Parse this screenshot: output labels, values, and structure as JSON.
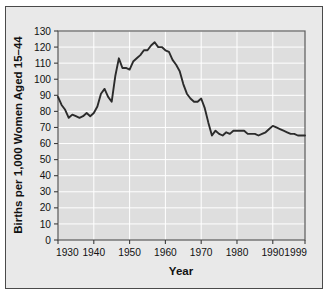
{
  "figure": {
    "background_color": "#ffffff",
    "frame_color": "#e9e9e9",
    "frame_border_color": "#4a4a4a",
    "plot_background_color": "#dedede",
    "gridline_color": "#ffffff",
    "axis_color": "#3c3c3c",
    "line_color": "#2b2b2b"
  },
  "chart_data": {
    "type": "line",
    "title": "",
    "xlabel": "Year",
    "ylabel": "Births per 1,000 Women Aged 15–44",
    "xlim": [
      1930,
      1999
    ],
    "ylim": [
      0,
      130
    ],
    "grid": true,
    "legend": "none",
    "xticks": [
      1930,
      1940,
      1950,
      1960,
      1970,
      1980,
      1990,
      1999
    ],
    "xtick_labels": [
      "1930",
      "1940",
      "1950",
      "1960",
      "1970",
      "1980",
      "1990",
      "1999"
    ],
    "yticks": [
      0,
      10,
      20,
      30,
      40,
      50,
      60,
      70,
      80,
      90,
      100,
      110,
      120,
      130
    ],
    "ytick_labels": [
      "0",
      "10",
      "20",
      "30",
      "40",
      "50",
      "60",
      "70",
      "80",
      "90",
      "100",
      "110",
      "120",
      "130"
    ],
    "x": [
      1930,
      1931,
      1932,
      1933,
      1934,
      1935,
      1936,
      1937,
      1938,
      1939,
      1940,
      1941,
      1942,
      1943,
      1944,
      1945,
      1946,
      1947,
      1948,
      1949,
      1950,
      1951,
      1952,
      1953,
      1954,
      1955,
      1956,
      1957,
      1958,
      1959,
      1960,
      1961,
      1962,
      1963,
      1964,
      1965,
      1966,
      1967,
      1968,
      1969,
      1970,
      1971,
      1972,
      1973,
      1974,
      1975,
      1976,
      1977,
      1978,
      1979,
      1980,
      1981,
      1982,
      1983,
      1984,
      1985,
      1986,
      1987,
      1988,
      1989,
      1990,
      1991,
      1992,
      1993,
      1994,
      1995,
      1996,
      1997,
      1998,
      1999
    ],
    "values": [
      89,
      84,
      81,
      76,
      78,
      77,
      76,
      77,
      79,
      77,
      79,
      83,
      91,
      94,
      89,
      86,
      102,
      113,
      107,
      107,
      106,
      111,
      113,
      115,
      118,
      118,
      121,
      123,
      120,
      120,
      118,
      117,
      112,
      109,
      105,
      97,
      91,
      88,
      86,
      86,
      88,
      82,
      73,
      65,
      68,
      66,
      65,
      67,
      66,
      68,
      68,
      68,
      68,
      66,
      66,
      66,
      65,
      66,
      67,
      69,
      71,
      70,
      69,
      68,
      67,
      66,
      66,
      65,
      65,
      65
    ],
    "data_note": "Fertility rate: births per 1,000 women aged 15-44, United States, 1930-1999"
  },
  "axis_titles": {
    "y": "Births per 1,000 Women Aged 15–44",
    "x": "Year"
  }
}
